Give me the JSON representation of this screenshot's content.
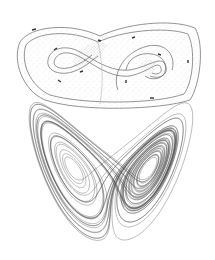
{
  "figure": {
    "background": "#ffffff",
    "stroke_color": "#555555",
    "stipple_color": "#9a9a9a",
    "panels": [
      {
        "name": "template",
        "label": ""
      },
      {
        "name": "attractor",
        "label": ""
      }
    ]
  }
}
